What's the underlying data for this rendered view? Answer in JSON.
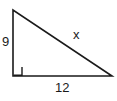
{
  "figure": {
    "type": "right-triangle",
    "background_color": "#ffffff",
    "stroke_color": "#1a1a1a",
    "stroke_width": 1.6,
    "label_color": "#1a1a1a"
  },
  "geometry": {
    "vertices": {
      "top": {
        "x": 13,
        "y": 10
      },
      "bottom_left": {
        "x": 13,
        "y": 76
      },
      "bottom_right": {
        "x": 112,
        "y": 76
      }
    },
    "right_angle_marker": {
      "vertex": "bottom_left",
      "size": 9,
      "x": 13,
      "y": 67
    }
  },
  "labels": {
    "vertical_leg": "9",
    "horizontal_leg": "12",
    "hypotenuse": "x"
  }
}
